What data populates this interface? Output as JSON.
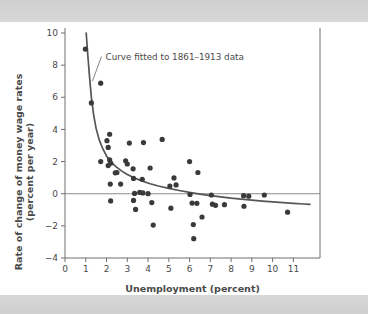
{
  "figure": {
    "background_color": "#ffffff",
    "band_color": "#d3d3d3",
    "dot_color": "#3a3a3a",
    "curve_color": "#555555",
    "axis_color": "#6f6f6f"
  },
  "chart_data": {
    "type": "scatter",
    "title": "",
    "xlabel": "Unemployment (percent)",
    "ylabel": "Rate of change of money wage rates\n(percent per year)",
    "ylabel_line1": "Rate of change of money wage rates",
    "ylabel_line2": "(percent per year)",
    "xlim": [
      0,
      11.8
    ],
    "ylim": [
      -4,
      10
    ],
    "xticks": [
      0,
      1,
      2,
      3,
      4,
      5,
      6,
      7,
      8,
      9,
      10,
      11
    ],
    "xticklabels": [
      "0",
      "1",
      "2",
      "3",
      "4",
      "5",
      "6",
      "7",
      "8",
      "9",
      "10",
      "11"
    ],
    "yticks": [
      -4,
      -2,
      0,
      2,
      4,
      6,
      8,
      10
    ],
    "yticklabels": [
      "-4",
      "-2",
      "0",
      "2",
      "4",
      "6",
      "8",
      "10"
    ],
    "grid": false,
    "legend": null,
    "zero_reference_line": 0,
    "annotations": [
      {
        "text": "Curve fitted to 1861–1913 data",
        "x": 1.95,
        "y": 8.35,
        "points_to_x": 1.32,
        "points_to_y": 7.0
      }
    ],
    "series": [
      {
        "name": "Observations",
        "type": "scatter",
        "marker": "circle",
        "points": [
          [
            0.98,
            9.0
          ],
          [
            1.27,
            5.65
          ],
          [
            1.72,
            6.88
          ],
          [
            1.72,
            2.0
          ],
          [
            2.02,
            3.3
          ],
          [
            2.08,
            2.88
          ],
          [
            2.15,
            3.7
          ],
          [
            2.08,
            1.75
          ],
          [
            2.15,
            2.1
          ],
          [
            2.2,
            1.9
          ],
          [
            2.18,
            0.6
          ],
          [
            2.2,
            -0.45
          ],
          [
            2.42,
            1.3
          ],
          [
            2.5,
            1.32
          ],
          [
            2.68,
            0.6
          ],
          [
            2.92,
            2.05
          ],
          [
            3.0,
            1.85
          ],
          [
            3.1,
            3.15
          ],
          [
            3.28,
            1.55
          ],
          [
            3.3,
            0.95
          ],
          [
            3.3,
            -0.42
          ],
          [
            3.35,
            0.02
          ],
          [
            3.4,
            -0.98
          ],
          [
            3.6,
            0.08
          ],
          [
            3.72,
            0.9
          ],
          [
            3.75,
            0.05
          ],
          [
            3.78,
            3.18
          ],
          [
            4.0,
            0.0
          ],
          [
            4.1,
            1.6
          ],
          [
            4.18,
            -0.55
          ],
          [
            4.25,
            -1.95
          ],
          [
            4.68,
            3.38
          ],
          [
            5.05,
            0.48
          ],
          [
            5.1,
            -0.9
          ],
          [
            5.25,
            0.98
          ],
          [
            5.35,
            0.55
          ],
          [
            6.0,
            2.0
          ],
          [
            6.02,
            -0.05
          ],
          [
            6.12,
            -0.58
          ],
          [
            6.18,
            -1.92
          ],
          [
            6.2,
            -2.8
          ],
          [
            6.35,
            -0.6
          ],
          [
            6.4,
            1.32
          ],
          [
            6.6,
            -1.45
          ],
          [
            7.05,
            -0.08
          ],
          [
            7.1,
            -0.65
          ],
          [
            7.25,
            -0.72
          ],
          [
            7.68,
            -0.68
          ],
          [
            8.6,
            -0.12
          ],
          [
            8.62,
            -0.78
          ],
          [
            8.85,
            -0.15
          ],
          [
            9.6,
            -0.08
          ],
          [
            10.72,
            -1.15
          ]
        ]
      },
      {
        "name": "Curve fitted to 1861–1913 data",
        "type": "line",
        "description": "Fitted Phillips curve, steeply falling hyperbola approaching a slightly negative asymptote",
        "points": [
          [
            1.02,
            10.0
          ],
          [
            1.1,
            8.6
          ],
          [
            1.18,
            7.3
          ],
          [
            1.27,
            6.0
          ],
          [
            1.38,
            4.9
          ],
          [
            1.5,
            4.05
          ],
          [
            1.65,
            3.35
          ],
          [
            1.82,
            2.8
          ],
          [
            2.0,
            2.35
          ],
          [
            2.2,
            2.0
          ],
          [
            2.45,
            1.68
          ],
          [
            2.72,
            1.42
          ],
          [
            3.0,
            1.2
          ],
          [
            3.35,
            0.98
          ],
          [
            3.7,
            0.8
          ],
          [
            4.1,
            0.62
          ],
          [
            4.5,
            0.48
          ],
          [
            5.0,
            0.33
          ],
          [
            5.5,
            0.2
          ],
          [
            6.0,
            0.08
          ],
          [
            6.5,
            -0.02
          ],
          [
            7.0,
            -0.12
          ],
          [
            7.5,
            -0.2
          ],
          [
            8.0,
            -0.28
          ],
          [
            8.5,
            -0.34
          ],
          [
            9.0,
            -0.4
          ],
          [
            9.5,
            -0.46
          ],
          [
            10.0,
            -0.51
          ],
          [
            10.5,
            -0.56
          ],
          [
            11.0,
            -0.6
          ],
          [
            11.5,
            -0.64
          ],
          [
            11.8,
            -0.66
          ]
        ]
      }
    ]
  }
}
